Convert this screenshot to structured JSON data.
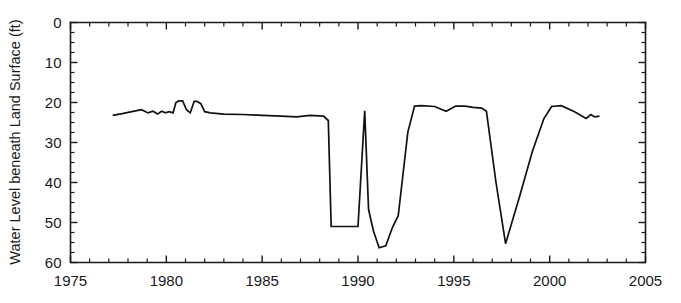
{
  "chart_data": {
    "type": "line",
    "title": "",
    "xlabel": "",
    "ylabel": "Water Level beneath Land Surface (ft)",
    "xlim": [
      1975,
      2005
    ],
    "ylim": [
      0,
      60
    ],
    "y_inverted": true,
    "grid": false,
    "legend": null,
    "x_ticks_major": [
      1975,
      1980,
      1985,
      1990,
      1995,
      2000,
      2005
    ],
    "x_tick_labels": [
      "1975",
      "1980",
      "1985",
      "1990",
      "1995",
      "2000",
      "2005"
    ],
    "x_tick_minor_step": 1,
    "y_ticks_major": [
      0,
      10,
      20,
      30,
      40,
      50,
      60
    ],
    "y_tick_labels": [
      "0",
      "10",
      "20",
      "30",
      "40",
      "50",
      "60"
    ],
    "y_tick_minor_step": 2.5,
    "line_color": "#111111",
    "series": [
      {
        "name": "Water level",
        "x": [
          1977.2,
          1977.7,
          1978.2,
          1978.7,
          1979.05,
          1979.3,
          1979.55,
          1979.75,
          1979.95,
          1980.15,
          1980.35,
          1980.5,
          1980.65,
          1980.85,
          1981.05,
          1981.25,
          1981.45,
          1981.6,
          1981.8,
          1982.0,
          1982.3,
          1983.0,
          1984.0,
          1985.0,
          1986.0,
          1986.8,
          1987.5,
          1988.2,
          1988.45,
          1988.6,
          1989.3,
          1990.0,
          1990.35,
          1990.55,
          1990.8,
          1991.1,
          1991.45,
          1991.8,
          1992.1,
          1992.6,
          1992.95,
          1993.3,
          1994.0,
          1994.6,
          1995.1,
          1995.6,
          1996.0,
          1996.45,
          1996.7,
          1997.2,
          1997.7,
          1998.4,
          1999.1,
          1999.7,
          2000.1,
          2000.6,
          2001.3,
          2001.9,
          2002.15,
          2002.35,
          2002.6
        ],
        "y": [
          23.2,
          22.8,
          22.3,
          21.8,
          22.6,
          22.2,
          22.9,
          22.2,
          22.6,
          22.3,
          22.6,
          20.0,
          19.6,
          19.6,
          21.8,
          22.6,
          19.7,
          19.7,
          20.3,
          22.3,
          22.6,
          22.9,
          23.0,
          23.2,
          23.4,
          23.6,
          23.2,
          23.4,
          24.5,
          51.0,
          51.0,
          51.0,
          22.1,
          46.7,
          52.0,
          56.3,
          55.8,
          51.2,
          48.3,
          27.4,
          20.9,
          20.8,
          21.0,
          22.2,
          20.9,
          20.9,
          21.2,
          21.4,
          22.2,
          40.0,
          55.3,
          44.0,
          32.2,
          24.0,
          21.0,
          20.8,
          22.3,
          24.0,
          23.0,
          23.6,
          23.4
        ]
      }
    ]
  },
  "axis": {
    "y_title": "Water Level beneath Land Surface (ft)"
  }
}
